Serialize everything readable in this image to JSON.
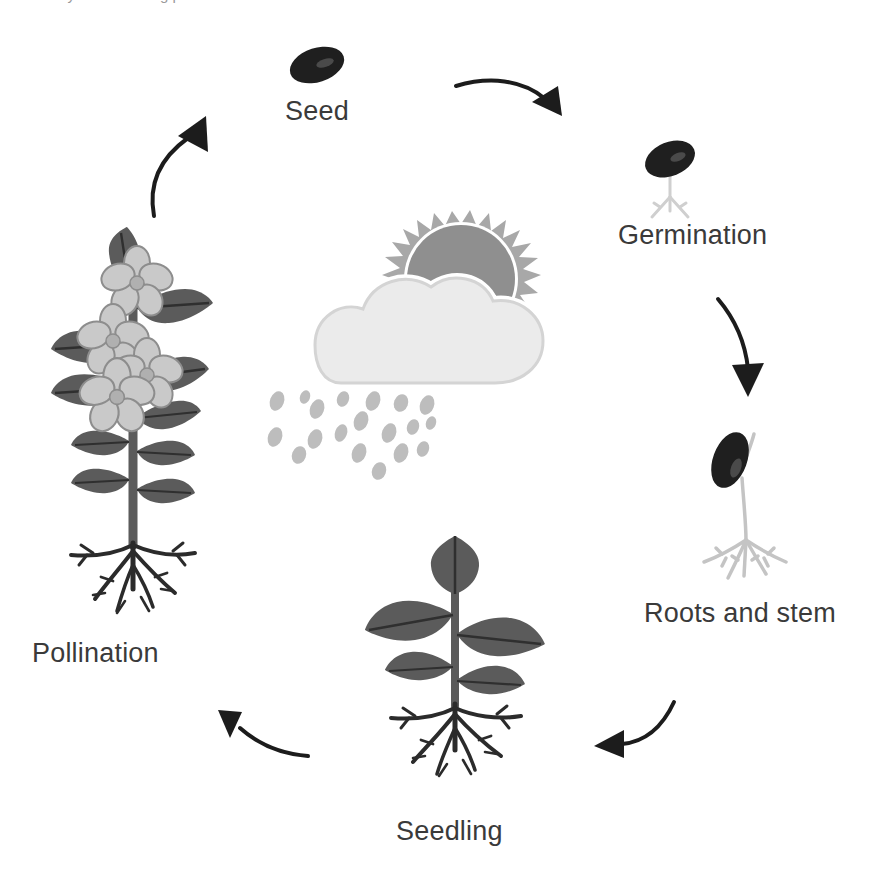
{
  "diagram": {
    "type": "cycle-diagram",
    "background_color": "#ffffff",
    "label_color": "#3a3a3a",
    "partial_top_text": "cy of a flowering plant"
  },
  "palette": {
    "seed_dark": "#1f1f1f",
    "seed_highlight": "#4a4a4a",
    "leaf_gray": "#5b5b5b",
    "leaf_vein": "#2f2f2f",
    "root_dark": "#2b2b2b",
    "sprout_pale": "#cfcfcf",
    "flower_light": "#c9c9c9",
    "flower_outline": "#8d8d8d",
    "sun_gray": "#8f8f8f",
    "sun_ray_gray": "#a8a8a8",
    "cloud_gray": "#ebebeb",
    "cloud_outline": "#cfcfcf",
    "rain_gray": "#bdbdbd",
    "arrow_black": "#1c1c1c"
  },
  "stages": [
    {
      "id": "seed",
      "label": "Seed",
      "order": 1,
      "icon": "seed-icon",
      "label_x": 285,
      "label_y": 98,
      "art_x": 282,
      "art_y": 40
    },
    {
      "id": "germination",
      "label": "Germination",
      "order": 2,
      "icon": "germinating-seed-icon",
      "label_x": 618,
      "label_y": 222,
      "art_x": 630,
      "art_y": 135
    },
    {
      "id": "roots-and-stem",
      "label": "Roots and stem",
      "order": 3,
      "icon": "sprout-with-roots-icon",
      "label_x": 644,
      "label_y": 600,
      "art_x": 690,
      "art_y": 428
    },
    {
      "id": "seedling",
      "label": "Seedling",
      "order": 4,
      "icon": "seedling-plant-icon",
      "label_x": 396,
      "label_y": 818,
      "art_x": 355,
      "art_y": 518
    },
    {
      "id": "pollination",
      "label": "Pollination",
      "order": 5,
      "icon": "flowering-plant-icon",
      "label_x": 32,
      "label_y": 640,
      "art_x": 45,
      "art_y": 245
    }
  ],
  "arrows": [
    {
      "id": "arrow-pollination-to-seed",
      "from": "pollination",
      "to": "seed",
      "direction": "up-right",
      "x": 110,
      "y": 80
    },
    {
      "id": "arrow-seed-to-germination",
      "from": "seed",
      "to": "germination",
      "direction": "right-down",
      "x": 450,
      "y": 58
    },
    {
      "id": "arrow-germination-to-roots",
      "from": "germination",
      "to": "roots-and-stem",
      "direction": "down",
      "x": 702,
      "y": 285
    },
    {
      "id": "arrow-roots-to-seedling",
      "from": "roots-and-stem",
      "to": "seedling",
      "direction": "left-down",
      "x": 572,
      "y": 692
    },
    {
      "id": "arrow-seedling-to-pollination",
      "from": "seedling",
      "to": "pollination",
      "direction": "up-left",
      "x": 186,
      "y": 668
    }
  ],
  "center_illustration": {
    "id": "sun-cloud-rain",
    "elements": [
      "sun-icon",
      "cloud-icon",
      "raindrops-icon"
    ],
    "x": 255,
    "y": 205
  }
}
